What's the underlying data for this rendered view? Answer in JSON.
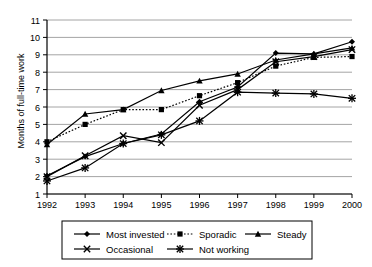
{
  "chart_data": {
    "type": "line",
    "title": "",
    "xlabel": "",
    "ylabel": "Months of full-time work",
    "categories": [
      "1992",
      "1993",
      "1994",
      "1995",
      "1996",
      "1997",
      "1998",
      "1999",
      "2000"
    ],
    "x": [
      1992,
      1993,
      1994,
      1995,
      1996,
      1997,
      1998,
      1999,
      2000
    ],
    "ylim": [
      1,
      11
    ],
    "xlim": [
      1992,
      2000
    ],
    "yticks": [
      "1",
      "2",
      "3",
      "4",
      "5",
      "6",
      "7",
      "8",
      "9",
      "10",
      "11"
    ],
    "ytick_values": [
      1,
      2,
      3,
      4,
      5,
      6,
      7,
      8,
      9,
      10,
      11
    ],
    "grid": "horizontal",
    "legend_position": "bottom",
    "series": [
      {
        "name": "Most invested",
        "marker": "diamond",
        "line_style": "solid",
        "color": "#000000",
        "values": [
          2.05,
          3.15,
          3.9,
          4.45,
          6.3,
          7.15,
          9.1,
          9.05,
          9.75
        ]
      },
      {
        "name": "Sporadic",
        "marker": "square",
        "line_style": "dotted",
        "color": "#000000",
        "values": [
          4.0,
          5.0,
          5.85,
          5.85,
          6.65,
          7.4,
          8.35,
          8.85,
          8.9
        ]
      },
      {
        "name": "Steady",
        "marker": "triangle",
        "line_style": "solid",
        "color": "#000000",
        "values": [
          3.85,
          5.6,
          5.85,
          6.95,
          7.5,
          7.9,
          8.7,
          9.05,
          9.4
        ]
      },
      {
        "name": "Occasional",
        "marker": "cross",
        "line_style": "solid",
        "color": "#000000",
        "values": [
          2.0,
          3.2,
          4.35,
          3.95,
          6.1,
          7.0,
          8.6,
          8.9,
          9.3
        ]
      },
      {
        "name": "Not working",
        "marker": "star",
        "line_style": "solid",
        "color": "#000000",
        "values": [
          1.75,
          2.5,
          3.9,
          4.4,
          5.2,
          6.85,
          6.8,
          6.75,
          6.5
        ]
      }
    ]
  }
}
